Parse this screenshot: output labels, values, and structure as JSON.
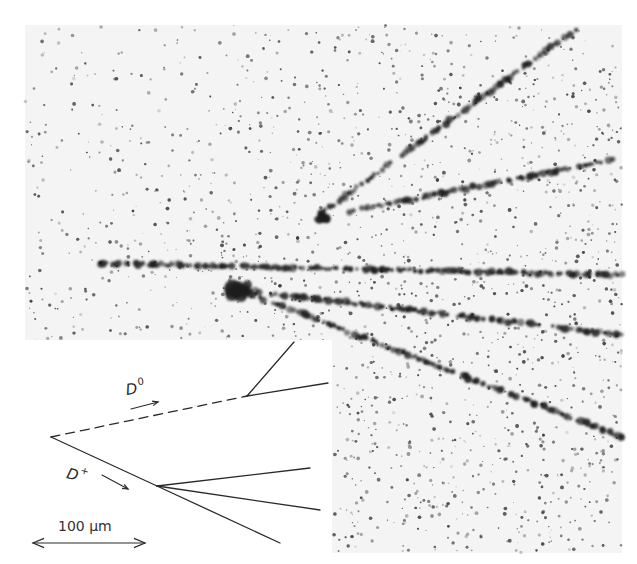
{
  "figure": {
    "type": "nuclear-emulsion photomicrograph with schematic inset",
    "photo": {
      "region": {
        "x": 25,
        "y": 25,
        "width": 597,
        "height": 528
      },
      "background": "#f4f4f4",
      "grain_color": "#3a3a3a",
      "track_color": "#1c1c1c",
      "tracks": [
        {
          "name": "d0-decay-upper-track",
          "from": [
            318,
            216
          ],
          "to": [
            575,
            30
          ]
        },
        {
          "name": "d0-decay-lower-track",
          "from": [
            346,
            212
          ],
          "to": [
            622,
            158
          ]
        },
        {
          "name": "main-track-horizontal",
          "from": [
            97,
            263
          ],
          "to": [
            622,
            275
          ]
        },
        {
          "name": "main-track-middle",
          "from": [
            240,
            290
          ],
          "to": [
            622,
            335
          ]
        },
        {
          "name": "main-track-lower",
          "from": [
            240,
            290
          ],
          "to": [
            622,
            437
          ]
        }
      ],
      "blobs": [
        {
          "name": "primary-vertex-blob",
          "cx": 240,
          "cy": 290,
          "r": 11
        },
        {
          "name": "d0-vertex-blob",
          "cx": 322,
          "cy": 218,
          "r": 6
        }
      ]
    },
    "inset": {
      "region": {
        "x": 0,
        "y": 340,
        "width": 332,
        "height": 224
      },
      "background": "#ffffff",
      "line_color": "#2a2a2a",
      "primary_vertex": [
        51,
        437
      ],
      "d0": {
        "label": "D",
        "superscript": "0",
        "path_dashed": {
          "from": [
            51,
            437
          ],
          "to": [
            247,
            396
          ]
        },
        "decay_vertex": [
          247,
          396
        ],
        "products": [
          {
            "to": [
              294,
              342
            ]
          },
          {
            "to": [
              328,
              383
            ]
          }
        ],
        "label_pos": {
          "x": 127,
          "y": 381
        },
        "arrow": {
          "from": [
            131,
            409
          ],
          "to": [
            158,
            402
          ]
        }
      },
      "dplus": {
        "label": "D",
        "superscript": "+",
        "path_solid": {
          "from": [
            51,
            437
          ],
          "to": [
            157,
            486
          ]
        },
        "decay_vertex": [
          157,
          486
        ],
        "products": [
          {
            "to": [
              310,
              468
            ]
          },
          {
            "to": [
              320,
              510
            ]
          },
          {
            "to": [
              280,
              543
            ]
          }
        ],
        "label_pos": {
          "x": 65,
          "y": 464
        },
        "arrow": {
          "from": [
            102,
            475
          ],
          "to": [
            128,
            489
          ]
        }
      },
      "scale_bar": {
        "label": "100 μm",
        "label_pos": {
          "x": 58,
          "y": 519
        },
        "from": [
          33,
          543
        ],
        "to": [
          145,
          543
        ]
      }
    }
  }
}
